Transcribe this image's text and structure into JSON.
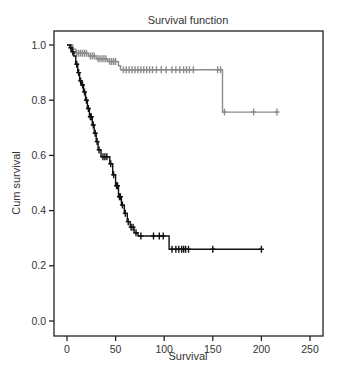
{
  "chart_data": {
    "type": "line",
    "subtype": "kaplan-meier-step",
    "title": "Survival function",
    "xlabel": "Survival",
    "ylabel": "Cum survival",
    "xlim": [
      -9,
      265
    ],
    "ylim": [
      -0.055,
      1.05
    ],
    "xticks": [
      0,
      50,
      100,
      150,
      200,
      250
    ],
    "yticks": [
      0.0,
      0.2,
      0.4,
      0.6,
      0.8,
      1.0
    ],
    "ytick_labels": [
      "0.0",
      "0.2",
      "0.4",
      "0.6",
      "0.8",
      "1.0"
    ],
    "grid": false,
    "legend": null,
    "series": [
      {
        "name": "group-gray",
        "color": "#8c8c8c",
        "steps": [
          [
            0,
            1.0
          ],
          [
            6,
            1.0
          ],
          [
            6,
            0.985
          ],
          [
            9,
            0.985
          ],
          [
            9,
            0.97
          ],
          [
            22,
            0.97
          ],
          [
            22,
            0.96
          ],
          [
            30,
            0.96
          ],
          [
            30,
            0.95
          ],
          [
            42,
            0.95
          ],
          [
            42,
            0.94
          ],
          [
            53,
            0.94
          ],
          [
            53,
            0.925
          ],
          [
            55,
            0.925
          ],
          [
            55,
            0.91
          ],
          [
            160,
            0.91
          ],
          [
            160,
            0.757
          ],
          [
            216,
            0.757
          ]
        ],
        "censored": [
          [
            10,
            0.97
          ],
          [
            12,
            0.97
          ],
          [
            14,
            0.97
          ],
          [
            16,
            0.97
          ],
          [
            18,
            0.97
          ],
          [
            20,
            0.97
          ],
          [
            24,
            0.96
          ],
          [
            26,
            0.96
          ],
          [
            28,
            0.96
          ],
          [
            32,
            0.95
          ],
          [
            34,
            0.95
          ],
          [
            36,
            0.95
          ],
          [
            38,
            0.95
          ],
          [
            40,
            0.95
          ],
          [
            44,
            0.94
          ],
          [
            46,
            0.94
          ],
          [
            48,
            0.94
          ],
          [
            50,
            0.94
          ],
          [
            58,
            0.91
          ],
          [
            61,
            0.91
          ],
          [
            64,
            0.91
          ],
          [
            67,
            0.91
          ],
          [
            70,
            0.91
          ],
          [
            73,
            0.91
          ],
          [
            76,
            0.91
          ],
          [
            79,
            0.91
          ],
          [
            82,
            0.91
          ],
          [
            85,
            0.91
          ],
          [
            88,
            0.91
          ],
          [
            92,
            0.91
          ],
          [
            97,
            0.91
          ],
          [
            102,
            0.91
          ],
          [
            108,
            0.91
          ],
          [
            112,
            0.91
          ],
          [
            116,
            0.91
          ],
          [
            120,
            0.91
          ],
          [
            123,
            0.91
          ],
          [
            126,
            0.91
          ],
          [
            130,
            0.91
          ],
          [
            155,
            0.91
          ],
          [
            158,
            0.91
          ],
          [
            162,
            0.757
          ],
          [
            192,
            0.757
          ],
          [
            216,
            0.757
          ]
        ]
      },
      {
        "name": "group-black",
        "color": "#111111",
        "steps": [
          [
            0,
            1.0
          ],
          [
            3,
            1.0
          ],
          [
            3,
            0.99
          ],
          [
            5,
            0.99
          ],
          [
            5,
            0.975
          ],
          [
            7,
            0.975
          ],
          [
            7,
            0.96
          ],
          [
            9,
            0.96
          ],
          [
            9,
            0.93
          ],
          [
            11,
            0.93
          ],
          [
            11,
            0.9
          ],
          [
            13,
            0.9
          ],
          [
            13,
            0.87
          ],
          [
            15,
            0.87
          ],
          [
            15,
            0.855
          ],
          [
            17,
            0.855
          ],
          [
            17,
            0.83
          ],
          [
            19,
            0.83
          ],
          [
            19,
            0.8
          ],
          [
            21,
            0.8
          ],
          [
            21,
            0.77
          ],
          [
            23,
            0.77
          ],
          [
            23,
            0.74
          ],
          [
            26,
            0.74
          ],
          [
            26,
            0.71
          ],
          [
            28,
            0.71
          ],
          [
            28,
            0.68
          ],
          [
            30,
            0.68
          ],
          [
            30,
            0.65
          ],
          [
            32,
            0.65
          ],
          [
            32,
            0.62
          ],
          [
            35,
            0.62
          ],
          [
            35,
            0.595
          ],
          [
            44,
            0.595
          ],
          [
            44,
            0.57
          ],
          [
            47,
            0.57
          ],
          [
            47,
            0.53
          ],
          [
            50,
            0.53
          ],
          [
            50,
            0.49
          ],
          [
            53,
            0.49
          ],
          [
            53,
            0.45
          ],
          [
            56,
            0.45
          ],
          [
            56,
            0.42
          ],
          [
            59,
            0.42
          ],
          [
            59,
            0.39
          ],
          [
            62,
            0.39
          ],
          [
            62,
            0.36
          ],
          [
            65,
            0.36
          ],
          [
            65,
            0.34
          ],
          [
            69,
            0.34
          ],
          [
            69,
            0.32
          ],
          [
            73,
            0.32
          ],
          [
            73,
            0.308
          ],
          [
            105,
            0.308
          ],
          [
            105,
            0.26
          ],
          [
            200,
            0.26
          ]
        ],
        "censored": [
          [
            4,
            0.99
          ],
          [
            6,
            0.975
          ],
          [
            10,
            0.93
          ],
          [
            12,
            0.9
          ],
          [
            14,
            0.87
          ],
          [
            16,
            0.855
          ],
          [
            18,
            0.83
          ],
          [
            20,
            0.8
          ],
          [
            22,
            0.77
          ],
          [
            24,
            0.74
          ],
          [
            25,
            0.74
          ],
          [
            27,
            0.71
          ],
          [
            29,
            0.68
          ],
          [
            31,
            0.65
          ],
          [
            33,
            0.62
          ],
          [
            37,
            0.595
          ],
          [
            39,
            0.595
          ],
          [
            41,
            0.595
          ],
          [
            45,
            0.57
          ],
          [
            48,
            0.53
          ],
          [
            51,
            0.49
          ],
          [
            52,
            0.49
          ],
          [
            54,
            0.45
          ],
          [
            55,
            0.45
          ],
          [
            57,
            0.42
          ],
          [
            60,
            0.39
          ],
          [
            63,
            0.36
          ],
          [
            66,
            0.34
          ],
          [
            68,
            0.34
          ],
          [
            71,
            0.32
          ],
          [
            76,
            0.308
          ],
          [
            89,
            0.308
          ],
          [
            95,
            0.308
          ],
          [
            99,
            0.308
          ],
          [
            108,
            0.26
          ],
          [
            112,
            0.26
          ],
          [
            115,
            0.26
          ],
          [
            118,
            0.26
          ],
          [
            120,
            0.26
          ],
          [
            122,
            0.26
          ],
          [
            125,
            0.26
          ],
          [
            150,
            0.26
          ],
          [
            200,
            0.26
          ]
        ]
      }
    ]
  }
}
